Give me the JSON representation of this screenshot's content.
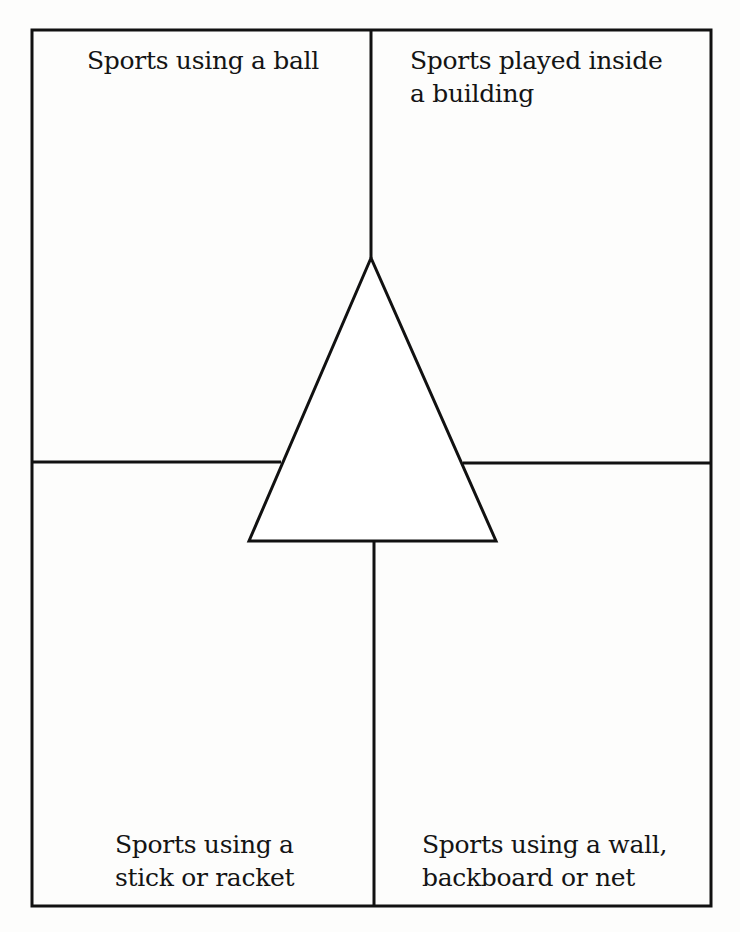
{
  "diagram": {
    "type": "four-quadrant graphic organizer with central triangle",
    "quadrants": {
      "top_left": {
        "label": "Sports using a ball"
      },
      "top_right": {
        "label": "Sports played inside\na building"
      },
      "bottom_left": {
        "label": "Sports using a\nstick or racket"
      },
      "bottom_right": {
        "label": "Sports using a wall,\nbackboard or net"
      }
    },
    "center_shape": "triangle",
    "line_color": "#111111",
    "background_color": "#fdfdfc"
  }
}
